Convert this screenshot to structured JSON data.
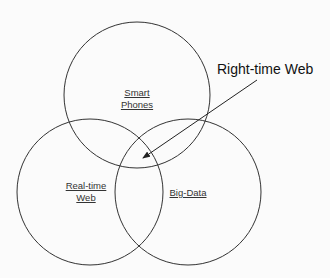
{
  "diagram": {
    "type": "venn",
    "sets": [
      {
        "id": "smart-phones",
        "line1": "Smart",
        "line2": "Phones",
        "cx": 137,
        "cy": 95,
        "r": 73
      },
      {
        "id": "real-time-web",
        "line1": "Real-time",
        "line2": "Web",
        "cx": 90,
        "cy": 192,
        "r": 73
      },
      {
        "id": "big-data",
        "line1": "Big-Data",
        "line2": "",
        "cx": 188,
        "cy": 192,
        "r": 73
      }
    ],
    "callout": {
      "label": "Right-time Web",
      "target": "intersection of all three sets"
    },
    "colors": {
      "stroke": "#333333",
      "background": "#fbfbfb"
    }
  }
}
